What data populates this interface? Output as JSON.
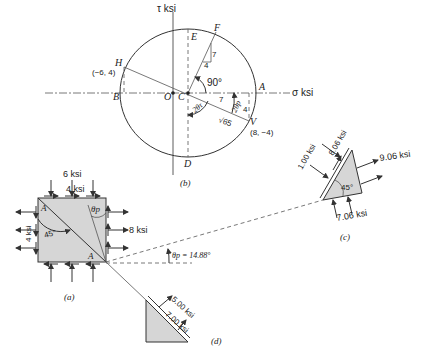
{
  "figure": {
    "mohr_circle": {
      "panel_label": "(b)",
      "axis_sigma_label": "σ ksi",
      "axis_tau_label": "τ ksi",
      "points": {
        "A": "A",
        "B": "B",
        "C": "C",
        "D": "D",
        "E": "E",
        "F": "F",
        "H": "H",
        "O": "O",
        "V": "V"
      },
      "coord_H": "(−6, 4)",
      "coord_V": "(8, −4)",
      "angle_90": "90°",
      "two_theta_tau": "2θτ",
      "two_theta_p": "2θp",
      "radius_label": "√65",
      "leg_7_upper": "7",
      "leg_4_upper": "4",
      "leg_7_lower": "7",
      "leg_4_lower": "4"
    },
    "element_a": {
      "panel_label": "(a)",
      "top_load": "6 ksi",
      "shear_top": "4 ksi",
      "right_load": "8 ksi",
      "shear_left": "4 ksi",
      "angle_45": "45°",
      "theta_p": "θp",
      "corner_A_top": "A",
      "corner_A_bottom": "A"
    },
    "wedge_c": {
      "panel_label": "(c)",
      "normal_left": "1.00 ksi",
      "shear_left": "8.06 ksi",
      "normal_right": "9.06 ksi",
      "bottom_load": "7.06 ksi",
      "angle_45": "45°"
    },
    "wedge_d": {
      "panel_label": "(d)",
      "normal": "5.00 ksi",
      "shear": "7.00 ksi"
    },
    "theta_p_value": "θp = 14.88°"
  }
}
